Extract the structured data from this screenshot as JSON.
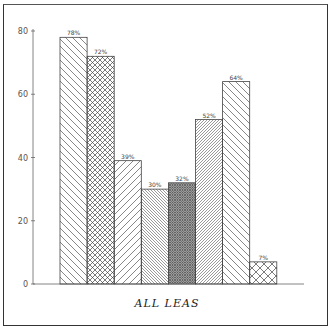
{
  "chart_data": {
    "type": "bar",
    "title": "",
    "xlabel": "ALL LEAS",
    "ylabel": "",
    "ylim": [
      0,
      80
    ],
    "yticks": [
      0,
      20,
      40,
      60,
      80
    ],
    "grid": false,
    "legend": null,
    "categories": [
      "1",
      "2",
      "3",
      "4",
      "5",
      "6",
      "7",
      "8"
    ],
    "values": [
      78,
      72,
      39,
      30,
      32,
      52,
      64,
      7
    ],
    "value_labels": [
      "78%",
      "72%",
      "39%",
      "30%",
      "32%",
      "52%",
      "64%",
      "7%"
    ],
    "patterns": [
      "diag-back-wide",
      "crosshatch-diamond",
      "diag-fwd-wide",
      "diag-back-dense",
      "crosshatch-dense",
      "diag-fwd-dense",
      "diag-back-wide",
      "crosshatch-diamond-large"
    ]
  },
  "axis": {
    "x_label": "ALL LEAS"
  }
}
